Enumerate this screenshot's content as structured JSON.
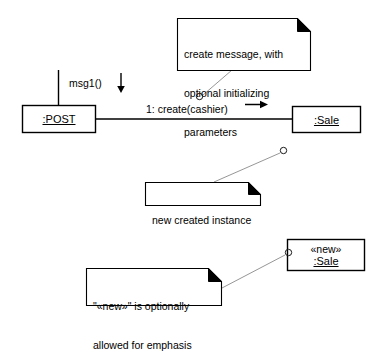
{
  "diagram": {
    "type": "uml-communication-diagram",
    "background_color": "#ffffff",
    "line_color": "#000000",
    "leader_color": "#808080"
  },
  "objects": [
    {
      "id": "post",
      "label": ":POST",
      "underlined": true,
      "stereotype": null
    },
    {
      "id": "sale",
      "label": ":Sale",
      "underlined": true,
      "stereotype": null
    },
    {
      "id": "new_sale",
      "label": ":Sale",
      "underlined": true,
      "stereotype": "«new»"
    }
  ],
  "messages": [
    {
      "id": "msg1",
      "label": "msg1()",
      "direction": "down",
      "arrow": "down-arrow-icon"
    },
    {
      "id": "create",
      "label": "1: create(cashier)",
      "direction": "right",
      "arrow": "right-arrow-icon"
    }
  ],
  "notes": [
    {
      "id": "note_create",
      "lines": [
        "create message, with",
        "optional initializing",
        "parameters"
      ],
      "text": "create message, with optional initializing parameters",
      "folded_corner": true,
      "anchor": "create-message-label"
    },
    {
      "id": "note_instance",
      "lines": [
        "new created instance"
      ],
      "text": "new created instance",
      "folded_corner": true,
      "anchor": "sale-object"
    },
    {
      "id": "note_emphasis",
      "lines": [
        "\"«new»\" is optionally",
        "allowed for emphasis"
      ],
      "text": "\"«new»\" is optionally allowed for emphasis",
      "folded_corner": true,
      "anchor": "new-sale-object"
    }
  ]
}
